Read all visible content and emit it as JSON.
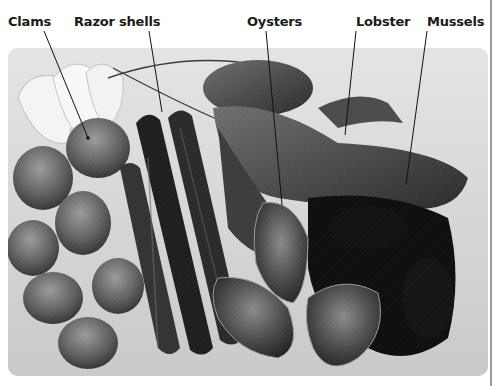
{
  "figure": {
    "type": "labelled-photograph",
    "colors": {
      "label_text": "#1a1a1a",
      "leader_line": "#111111",
      "edge_rule": "#9a9a9a"
    },
    "labels": [
      {
        "id": "clams",
        "text": "Clams",
        "x": 8,
        "anchor": [
          32,
          30
        ],
        "target": [
          88,
          138
        ]
      },
      {
        "id": "razor-shells",
        "text": "Razor shells",
        "x": 74,
        "anchor": [
          150,
          30
        ],
        "target": [
          162,
          112
        ]
      },
      {
        "id": "oysters",
        "text": "Oysters",
        "x": 247,
        "anchor": [
          265,
          30
        ],
        "target": [
          282,
          200
        ]
      },
      {
        "id": "lobster",
        "text": "Lobster",
        "x": 356,
        "anchor": [
          360,
          30
        ],
        "target": [
          345,
          135
        ]
      },
      {
        "id": "mussels",
        "text": "Mussels",
        "x": 427,
        "anchor": [
          432,
          30
        ],
        "target": [
          406,
          185
        ]
      }
    ],
    "regions": [
      {
        "name": "lemon-wedges",
        "description": "Lemon wedges, top left"
      },
      {
        "name": "clams",
        "description": "Pile of clams, left side"
      },
      {
        "name": "razor-shells",
        "description": "Long dark razor shells, centre-left"
      },
      {
        "name": "lobster",
        "description": "Whole lobster with claw, top right"
      },
      {
        "name": "oysters",
        "description": "Three rough oysters, bottom centre"
      },
      {
        "name": "mussels",
        "description": "Dark mussels, right side"
      }
    ]
  }
}
